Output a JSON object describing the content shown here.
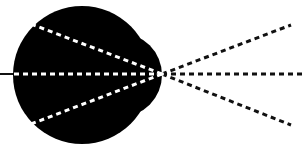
{
  "diagram": {
    "type": "optics-eye-ray-diagram",
    "colors": {
      "background": "#ffffff",
      "eye_fill": "#000000",
      "ray_inside_eye": "#ffffff",
      "ray_outside_eye": "#111111",
      "axis_line": "#111111"
    },
    "eyeball": {
      "cx": 82,
      "cy": 75,
      "r": 69
    },
    "cornea": {
      "cx": 120,
      "cy": 75,
      "rx": 42,
      "ry": 42
    },
    "focal_point": {
      "x": 162,
      "y": 74
    },
    "optical_axis_left": {
      "x1": 0,
      "y1": 74,
      "x2": 14,
      "y2": 74
    },
    "rays_inside": [
      {
        "name": "upper",
        "x1": 31,
        "y1": 24,
        "x2": 162,
        "y2": 74
      },
      {
        "name": "center",
        "x1": 14,
        "y1": 74,
        "x2": 162,
        "y2": 74
      },
      {
        "name": "lower",
        "x1": 31,
        "y1": 124,
        "x2": 162,
        "y2": 74
      }
    ],
    "rays_outside": [
      {
        "name": "upper",
        "x1": 162,
        "y1": 74,
        "x2": 291,
        "y2": 25
      },
      {
        "name": "center",
        "x1": 162,
        "y1": 74,
        "x2": 305,
        "y2": 74
      },
      {
        "name": "lower",
        "x1": 162,
        "y1": 74,
        "x2": 291,
        "y2": 125
      }
    ]
  }
}
